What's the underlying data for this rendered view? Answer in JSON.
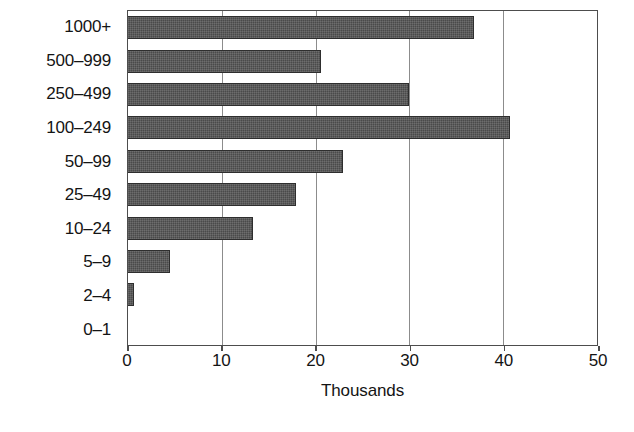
{
  "chart_data": {
    "type": "bar",
    "orientation": "horizontal",
    "title": "",
    "xlabel": "Thousands",
    "ylabel": "",
    "categories": [
      "1000+",
      "500–999",
      "250–499",
      "100–249",
      "50–99",
      "25–49",
      "10–24",
      "5–9",
      "2–4",
      "0–1"
    ],
    "values": [
      36.7,
      20.5,
      29.8,
      40.6,
      22.8,
      17.8,
      13.3,
      4.5,
      0.6,
      0
    ],
    "xlim": [
      0,
      50
    ],
    "xticks": [
      0,
      10,
      20,
      30,
      40,
      50
    ],
    "xtick_labels": [
      "0",
      "10",
      "20",
      "30",
      "40",
      "50"
    ],
    "grid": true,
    "grid_axis": "x",
    "legend": false,
    "bar_color": "#4a4a4a",
    "bar_edge_color": "#2e2e2e",
    "grid_color": "#8c8c8c",
    "axis_color": "#4d4d4d",
    "background_color": "#ffffff"
  }
}
